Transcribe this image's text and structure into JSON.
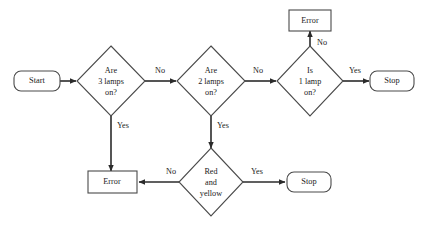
{
  "diagram": {
    "type": "flowchart",
    "background_color": "#ffffff",
    "line_color": "#2b2b2b",
    "shape_stroke_color": "#4a4a4a",
    "text_color": "#1a1a1a",
    "nodes": [
      {
        "id": "start",
        "shape": "terminator",
        "label": "Start",
        "lines": [
          "Start"
        ],
        "cx": 37,
        "cy": 81,
        "w": 46,
        "h": 20
      },
      {
        "id": "are-3-lamps-on",
        "shape": "decision",
        "label": "Are 3 lamps on?",
        "lines": [
          "Are",
          "3 lamps",
          "on?"
        ],
        "cx": 111,
        "cy": 81,
        "rx": 34,
        "ry": 35
      },
      {
        "id": "are-2-lamps-on",
        "shape": "decision",
        "label": "Are 2 lamps on?",
        "lines": [
          "Are",
          "2 lamps",
          "on?"
        ],
        "cx": 211,
        "cy": 81,
        "rx": 34,
        "ry": 35
      },
      {
        "id": "is-1-lamp-on",
        "shape": "decision",
        "label": "Is 1 lamp on?",
        "lines": [
          "Is",
          "1 lamp",
          "on?"
        ],
        "cx": 310,
        "cy": 81,
        "rx": 33,
        "ry": 35
      },
      {
        "id": "error-top",
        "shape": "process",
        "label": "Error",
        "lines": [
          "Error"
        ],
        "cx": 310,
        "cy": 20,
        "w": 42,
        "h": 20
      },
      {
        "id": "stop-right",
        "shape": "terminator",
        "label": "Stop",
        "lines": [
          "Stop"
        ],
        "cx": 392,
        "cy": 81,
        "w": 44,
        "h": 20
      },
      {
        "id": "red-and-yellow",
        "shape": "decision",
        "label": "Red and yellow",
        "lines": [
          "Red",
          "and",
          "yellow"
        ],
        "cx": 211,
        "cy": 182,
        "rx": 32,
        "ry": 34
      },
      {
        "id": "error-bottom",
        "shape": "process",
        "label": "Error",
        "lines": [
          "Error"
        ],
        "cx": 112,
        "cy": 182,
        "w": 49,
        "h": 21
      },
      {
        "id": "stop-bottom",
        "shape": "terminator",
        "label": "Stop",
        "lines": [
          "Stop"
        ],
        "cx": 309,
        "cy": 182,
        "w": 44,
        "h": 20
      }
    ],
    "edges": [
      {
        "id": "start-to-d1",
        "from": "start",
        "to": "are-3-lamps-on",
        "label": "",
        "points": "60,81 76,81",
        "arrow": true
      },
      {
        "id": "d1-no-to-d2",
        "from": "are-3-lamps-on",
        "to": "are-2-lamps-on",
        "label": "No",
        "label_x": 160,
        "label_y": 71,
        "points": "145,81 176,81",
        "arrow": true
      },
      {
        "id": "d1-yes-to-error-bottom",
        "from": "are-3-lamps-on",
        "to": "error-bottom",
        "label": "Yes",
        "label_x": 123,
        "label_y": 126,
        "points": "111,116 111,171",
        "arrow": true
      },
      {
        "id": "d2-no-to-d3",
        "from": "are-2-lamps-on",
        "to": "is-1-lamp-on",
        "label": "No",
        "label_x": 258,
        "label_y": 71,
        "points": "245,81 276,81",
        "arrow": true
      },
      {
        "id": "d2-yes-to-red-yellow",
        "from": "are-2-lamps-on",
        "to": "red-and-yellow",
        "label": "Yes",
        "label_x": 223,
        "label_y": 126,
        "points": "211,116 211,148",
        "arrow": true
      },
      {
        "id": "d3-no-to-error-top",
        "from": "is-1-lamp-on",
        "to": "error-top",
        "label": "No",
        "label_x": 322,
        "label_y": 43,
        "points": "310,46 310,31",
        "arrow": true
      },
      {
        "id": "d3-yes-to-stop-right",
        "from": "is-1-lamp-on",
        "to": "stop-right",
        "label": "Yes",
        "label_x": 355,
        "label_y": 71,
        "points": "343,81 369,81",
        "arrow": true
      },
      {
        "id": "red-yellow-no-to-error-bottom",
        "from": "red-and-yellow",
        "to": "error-bottom",
        "label": "No",
        "label_x": 171,
        "label_y": 172,
        "points": "179,182 139,182",
        "arrow": true
      },
      {
        "id": "red-yellow-yes-to-stop-bottom",
        "from": "red-and-yellow",
        "to": "stop-bottom",
        "label": "Yes",
        "label_x": 257,
        "label_y": 172,
        "points": "243,182 285,182",
        "arrow": true
      }
    ]
  }
}
